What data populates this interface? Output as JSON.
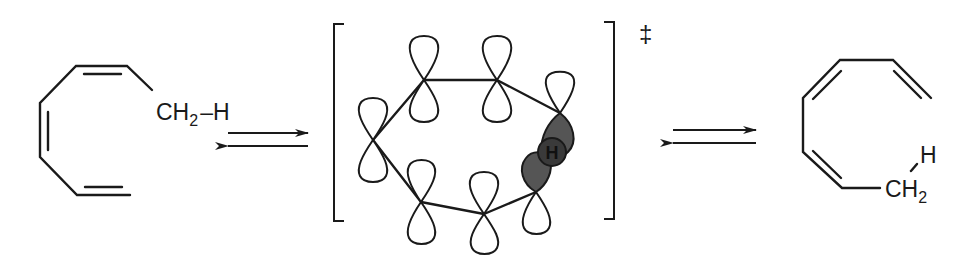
{
  "diagram": {
    "type": "reaction_scheme",
    "reactant": {
      "label_group": "CH",
      "label_sub": "2",
      "label_bond": "–H"
    },
    "equilibrium_arrow_1": "equilibrium",
    "transition_state": {
      "marker": "‡",
      "migrating_atom": "H",
      "p_orbital_count": 8,
      "shaded_lobes": 2
    },
    "equilibrium_arrow_2": "equilibrium",
    "product": {
      "label_h": "H",
      "label_group": "CH",
      "label_sub": "2"
    },
    "colors": {
      "line": "#1a1a1a",
      "shaded_lobe": "#555555",
      "h_atom_fill": "#3a3a3a",
      "background": "#ffffff"
    }
  }
}
